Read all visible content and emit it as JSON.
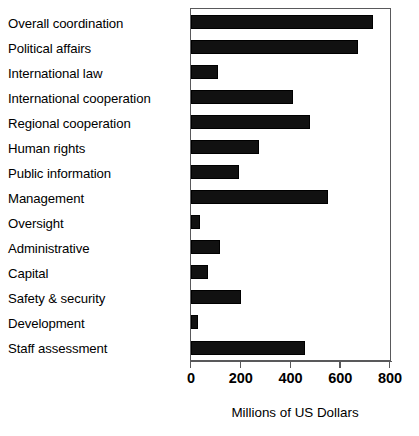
{
  "chart_data": {
    "type": "bar",
    "orientation": "horizontal",
    "title": "",
    "subtitle": "",
    "xlabel": "Millions of US Dollars",
    "ylabel": "",
    "xlim": [
      0,
      800
    ],
    "xticks": [
      0,
      200,
      400,
      600,
      800
    ],
    "xtick_labels": [
      "0",
      "200",
      "400",
      "600",
      "800"
    ],
    "grid": false,
    "legend": null,
    "bar_color": "#111111",
    "frame_color": "#59595b",
    "categories": [
      "Overall coordination",
      "Political affairs",
      "International law",
      "International cooperation",
      "Regional cooperation",
      "Human rights",
      "Public information",
      "Management",
      "Oversight",
      "Administrative",
      "Capital",
      "Safety & security",
      "Development",
      "Staff assessment"
    ],
    "values": [
      730,
      670,
      108,
      412,
      480,
      275,
      193,
      550,
      35,
      115,
      70,
      202,
      30,
      458
    ]
  }
}
